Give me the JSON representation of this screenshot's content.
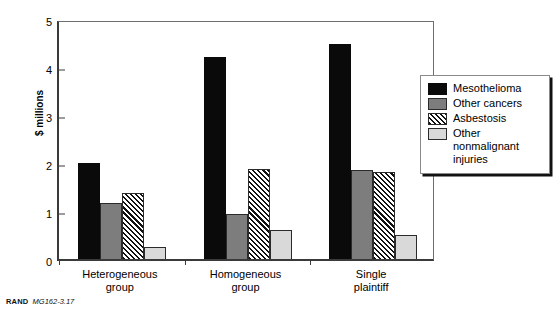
{
  "footer": {
    "brand": "RAND",
    "code": "MG162-3.17"
  },
  "legend": {
    "position": "right-outside",
    "entries": [
      {
        "label": "Mesothelioma",
        "swatch": "black-swatch-icon",
        "color": "#0a0a0a"
      },
      {
        "label": "Other cancers",
        "swatch": "dark-gray-swatch-icon",
        "color": "#7d7d7d"
      },
      {
        "label": "Asbestosis",
        "swatch": "hatched-swatch-icon",
        "color": "#ffffff"
      },
      {
        "label": "Other\nnonmalignant\ninjuries",
        "swatch": "light-gray-swatch-icon",
        "color": "#d9d9d9"
      }
    ]
  },
  "chart_data": {
    "type": "bar",
    "title": "",
    "subtitle": "",
    "xlabel": "",
    "ylabel": "$ millions",
    "ylim": [
      0,
      5
    ],
    "yticks": [
      0,
      1,
      2,
      3,
      4,
      5
    ],
    "grid": false,
    "categories": [
      "Heterogeneous\ngroup",
      "Homogeneous\ngroup",
      "Single\nplaintiff"
    ],
    "series": [
      {
        "name": "Mesothelioma",
        "color": "#0a0a0a",
        "fill": "fill-black",
        "values": [
          2.0,
          4.2,
          4.48
        ]
      },
      {
        "name": "Other cancers",
        "color": "#7d7d7d",
        "fill": "fill-darkgray",
        "values": [
          1.17,
          0.94,
          1.86
        ]
      },
      {
        "name": "Asbestosis",
        "color": "#ffffff",
        "fill": "fill-hatch",
        "values": [
          1.37,
          1.87,
          1.82
        ]
      },
      {
        "name": "Other nonmalignant injuries",
        "color": "#d9d9d9",
        "fill": "fill-lightgray",
        "values": [
          0.25,
          0.6,
          0.5
        ]
      }
    ]
  }
}
